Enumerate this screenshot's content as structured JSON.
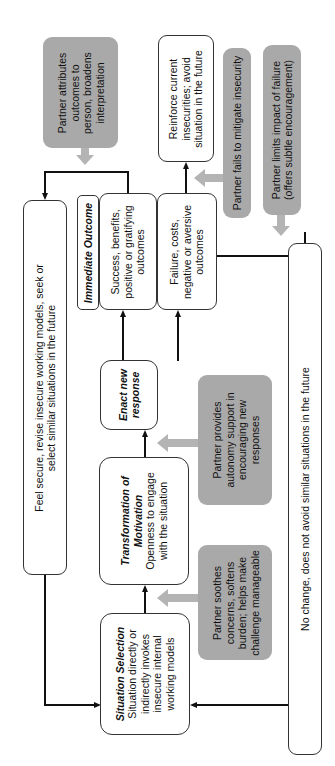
{
  "diagram": {
    "orientation": "rotated 90 degrees counter-clockwise",
    "colors": {
      "partner_box": "#a9a9a9",
      "gray_arrow": "#b4b4b4",
      "line": "#111111",
      "box_border": "#333333"
    },
    "nodes": {
      "situation_selection": {
        "title": "Situation Selection",
        "lines": [
          "Situation directly or",
          "indirectly invokes",
          "insecure internal",
          "working models"
        ]
      },
      "transformation": {
        "title_lines": [
          "Transformation of",
          "Motivation"
        ],
        "lines": [
          "Openness to engage",
          "with the situation"
        ]
      },
      "enact": {
        "title_lines": [
          "Enact new",
          "response"
        ]
      },
      "immediate_outcome": {
        "label": "Immediate Outcome"
      },
      "success": {
        "lines": [
          "Success, benefits,",
          "positive or gratifying",
          "outcomes"
        ]
      },
      "failure": {
        "lines": [
          "Failure, costs,",
          "negative or aversive",
          "outcomes"
        ]
      },
      "feel_secure": {
        "lines": [
          "Feel secure, revise insecure working models, seek or",
          "select similar situations in the future"
        ]
      },
      "reinforce": {
        "lines": [
          "Reinforce current",
          "insecurities; avoid",
          "situation in the future"
        ]
      },
      "no_change": {
        "lines": [
          "No change, does not avoid similar situations in the future"
        ]
      }
    },
    "partner_boxes": {
      "soothes": {
        "lines": [
          "Partner soothes",
          "concerns, softens",
          "burden; helps make",
          "challenge manageable"
        ]
      },
      "autonomy": {
        "lines": [
          "Partner provides",
          "autonomy support in",
          "encouraging new",
          "responses"
        ]
      },
      "attributes": {
        "lines": [
          "Partner attributes",
          "outcomes to",
          "person, broadens",
          "interpretation"
        ]
      },
      "fails": {
        "lines": [
          "Partner fails to mitigate insecurity"
        ]
      },
      "limits": {
        "lines": [
          "Partner limits impact of failure",
          "(offers subtle encouragement)"
        ]
      }
    }
  }
}
